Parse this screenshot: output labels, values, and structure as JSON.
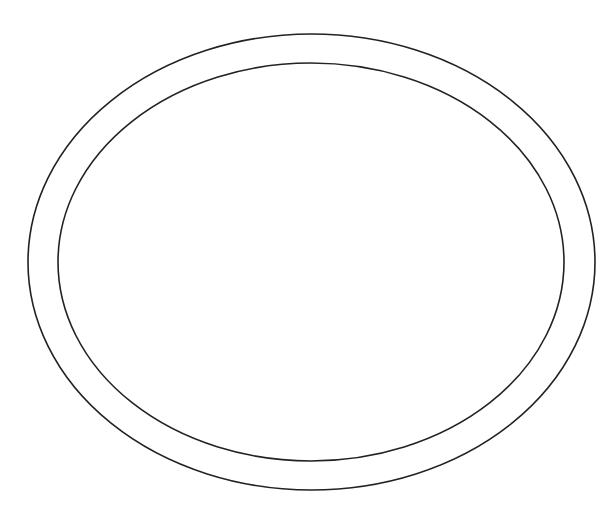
{
  "diagram": {
    "background": "#ffffff",
    "stroke_color": "#222222",
    "stroke_width": 1.6,
    "shapes": [
      {
        "name": "outer-ellipse",
        "type": "ellipse",
        "cx": 311.5,
        "cy": 262,
        "rx": 283.5,
        "ry": 228
      },
      {
        "name": "inner-ellipse",
        "type": "ellipse",
        "cx": 311,
        "cy": 262,
        "rx": 253,
        "ry": 199
      }
    ]
  }
}
